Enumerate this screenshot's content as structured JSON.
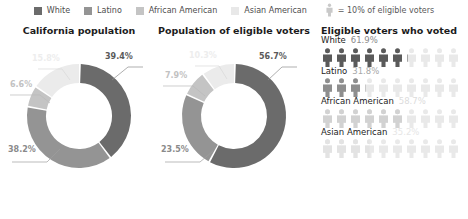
{
  "legend": {
    "items": [
      {
        "label": "White",
        "color": "#6b6b6b",
        "icon": "square-swatch"
      },
      {
        "label": "Latino",
        "color": "#949494",
        "icon": "square-swatch"
      },
      {
        "label": "African American",
        "color": "#c4c4c4",
        "icon": "square-swatch"
      },
      {
        "label": "Asian American",
        "color": "#e8e8e8",
        "icon": "square-swatch"
      }
    ],
    "key": {
      "label": "= 10% of eligible voters",
      "icon": "person-icon",
      "color": "#c9c9c9"
    }
  },
  "panels": {
    "population": {
      "title": "California population"
    },
    "eligible": {
      "title": "Population of eligible voters"
    },
    "voted": {
      "title": "Eligible voters who voted"
    }
  },
  "chart_data": [
    {
      "type": "pie",
      "title": "California population",
      "categories": [
        "White",
        "Latino",
        "African American",
        "Asian American"
      ],
      "values": [
        39.4,
        38.2,
        6.6,
        15.8
      ],
      "labels": [
        "39.4%",
        "38.2%",
        "6.6%",
        "15.8%"
      ],
      "colors": [
        "#6b6b6b",
        "#949494",
        "#c4c4c4",
        "#ebebeb"
      ],
      "label_colors": [
        "#5a5a5a",
        "#8a8a8a",
        "#bdbdbd",
        "#ededed"
      ],
      "ylabel": "",
      "xlabel": "",
      "legend": "top"
    },
    {
      "type": "pie",
      "title": "Population of eligible voters",
      "categories": [
        "White",
        "Latino",
        "African American",
        "Asian American"
      ],
      "values": [
        56.7,
        23.5,
        7.9,
        10.3
      ],
      "labels": [
        "56.7%",
        "23.5%",
        "7.9%",
        "10.3%"
      ],
      "colors": [
        "#6b6b6b",
        "#949494",
        "#c4c4c4",
        "#ebebeb"
      ],
      "label_colors": [
        "#5a5a5a",
        "#8a8a8a",
        "#bdbdbd",
        "#ededed"
      ],
      "ylabel": "",
      "xlabel": "",
      "legend": "top"
    },
    {
      "type": "pictogram",
      "title": "Eligible voters who voted",
      "unit": "= 10% of eligible voters",
      "unit_value": 10,
      "icons_per_row": 10,
      "categories": [
        "White",
        "Latino",
        "African American",
        "Asian American"
      ],
      "values": [
        61.9,
        31.8,
        58.7,
        35.2
      ],
      "labels": [
        "61.9%",
        "31.8%",
        "58.7%",
        "35.2%"
      ],
      "colors": [
        "#5a5a5a",
        "#8e8e8e",
        "#d2d2d2",
        "#e3e3e3"
      ],
      "empty_color": "#e9e9e9",
      "label_colors": [
        "#8a8a8a",
        "#a8a8a8",
        "#dcdcdc",
        "#e6e6e6"
      ]
    }
  ]
}
